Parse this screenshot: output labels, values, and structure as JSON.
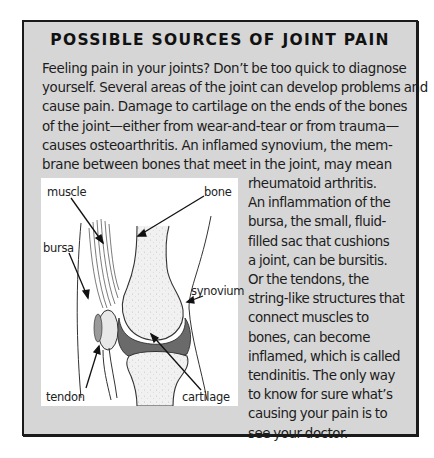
{
  "sidebar_box": {
    "title": "POSSIBLE SOURCES OF JOINT PAIN",
    "body_lines": [
      "Feeling pain in your joints? Don’t be too quick to diagnose",
      "yourself. Several areas of the joint can develop problems and",
      "cause pain. Damage to cartilage on the ends of the bones",
      "of the joint—either from wear-and-tear or from trauma—",
      "causes osteoarthritis. An inflamed synovium, the mem-",
      "brane between bones that meet in the joint, may mean"
    ],
    "side_lines": [
      "rheumatoid arthritis.",
      "An inflammation of the",
      "bursa, the small, fluid-",
      "filled sac that cushions",
      "a joint, can be bursitis.",
      "Or the tendons, the",
      "string-like structures that",
      "connect muscles to",
      "bones, can become",
      "inflamed, which is called",
      "tendinitis. The only way",
      "to know for sure what’s",
      "causing your pain is to",
      "see your doctor."
    ]
  },
  "figure": {
    "labels": {
      "muscle": "muscle",
      "bone": "bone",
      "bursa": "bursa",
      "synovium": "synovium",
      "tendon": "tendon",
      "cartilage": "cartilage"
    }
  },
  "colors": {
    "box_background": "#d6d6d6",
    "border": "#1a1a1a",
    "figure_background": "#ffffff"
  }
}
